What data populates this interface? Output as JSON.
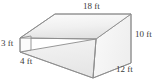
{
  "figure": {
    "name": "wedge-prism-solid",
    "type": "3d-solid-diagram",
    "solid": "ramp wedge prism with sloped front face",
    "unit": "ft",
    "labels": {
      "top_edge": "18 ft",
      "right_height": "10 ft",
      "left_height": "3 ft",
      "front_base": "4 ft",
      "depth": "12 ft"
    },
    "dimensions": [
      {
        "name": "top-length",
        "value": 18,
        "unit": "ft",
        "text": "18 ft"
      },
      {
        "name": "right-height",
        "value": 10,
        "unit": "ft",
        "text": "10 ft"
      },
      {
        "name": "left-height",
        "value": 3,
        "unit": "ft",
        "text": "3 ft"
      },
      {
        "name": "front-base",
        "value": 4,
        "unit": "ft",
        "text": "4 ft"
      },
      {
        "name": "depth",
        "value": 12,
        "unit": "ft",
        "text": "12 ft"
      }
    ],
    "colors": {
      "outline": "#8c8c8c",
      "top_face": "#f2f2f2",
      "front_face": "#ebebeb",
      "right_face": "#f6f6f6",
      "left_face": "#fbfbfb",
      "label_text": "#3b3b3b",
      "background": "#ffffff"
    }
  }
}
